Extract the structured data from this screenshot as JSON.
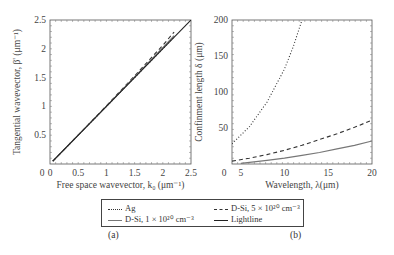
{
  "chart_data": [
    {
      "type": "line",
      "panel_label": "(a)",
      "xlabel": "Free space wavevector, k₀ (μm⁻¹)",
      "ylabel": "Tangential wavevector, β' (μm⁻¹)",
      "xlim": [
        0,
        2.5
      ],
      "ylim": [
        0,
        2.5
      ],
      "xticks": [
        "0",
        "0.5",
        "1",
        "1.5",
        "2",
        "2.5"
      ],
      "yticks": [
        "0.5",
        "1",
        "1.5",
        "2",
        "2.5"
      ],
      "grid": false,
      "series": [
        {
          "name": "Ag",
          "style": "dotted",
          "x": [
            0.05,
            0.5,
            1.0,
            1.5,
            2.0,
            2.2
          ],
          "y": [
            0.05,
            0.5,
            1.0,
            1.5,
            2.0,
            2.2
          ]
        },
        {
          "name": "D-Si, 5 × 10²⁰ cm⁻³",
          "style": "dashed",
          "x": [
            0.05,
            0.5,
            1.0,
            1.5,
            2.0,
            2.2
          ],
          "y": [
            0.05,
            0.5,
            1.01,
            1.53,
            2.06,
            2.29
          ]
        },
        {
          "name": "D-Si, 1 × 10²⁰ cm⁻³",
          "style": "solid-gray",
          "x": [
            0.05,
            0.5,
            1.0,
            1.5,
            2.0,
            2.2
          ],
          "y": [
            0.05,
            0.5,
            1.0,
            1.51,
            2.02,
            2.23
          ]
        },
        {
          "name": "Lightline",
          "style": "solid",
          "x": [
            0.05,
            2.5
          ],
          "y": [
            0.05,
            2.5
          ]
        }
      ]
    },
    {
      "type": "line",
      "panel_label": "(b)",
      "xlabel": "Wavelength, λ(μm)",
      "ylabel": "Confinment length δ (μm)",
      "xlim": [
        4,
        20
      ],
      "ylim": [
        0,
        200
      ],
      "xticks": [
        "5",
        "10",
        "15",
        "20"
      ],
      "yticks": [
        "0",
        "50",
        "100",
        "150",
        "200"
      ],
      "grid": false,
      "series": [
        {
          "name": "Ag",
          "style": "dotted",
          "x": [
            4,
            6,
            8,
            10,
            11,
            12
          ],
          "y": [
            28,
            52,
            86,
            132,
            163,
            200
          ]
        },
        {
          "name": "D-Si, 5 × 10²⁰ cm⁻³",
          "style": "dashed",
          "x": [
            4,
            6,
            8,
            10,
            12,
            14,
            16,
            18,
            20
          ],
          "y": [
            4,
            8,
            13,
            19,
            26,
            34,
            42,
            51,
            61
          ]
        },
        {
          "name": "D-Si, 1 × 10²⁰ cm⁻³",
          "style": "solid-gray",
          "x": [
            5,
            8,
            10,
            12,
            14,
            16,
            18,
            20
          ],
          "y": [
            1,
            5,
            8,
            12,
            16,
            21,
            26,
            32
          ]
        }
      ]
    }
  ],
  "legend": {
    "items": [
      {
        "label": "Ag",
        "style": "dotted"
      },
      {
        "label": "D-Si, 5 × 10²⁰ cm⁻³",
        "style": "dashed"
      },
      {
        "label": "D-Si, 1 × 10²⁰ cm⁻³",
        "style": "solid-gray"
      },
      {
        "label": "Lightline",
        "style": "solid"
      }
    ]
  },
  "panels": {
    "a": "(a)",
    "b": "(b)"
  },
  "colors": {
    "axis": "#555555",
    "dark_line": "#222222",
    "gray_line": "#777777"
  }
}
